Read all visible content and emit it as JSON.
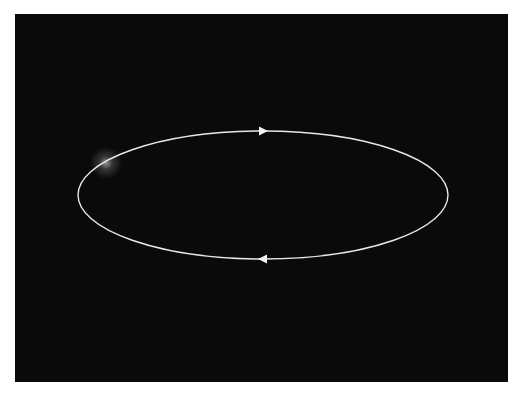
{
  "diagram": {
    "type": "orbit-loop",
    "background_color": "#0a0a0a",
    "page_color": "#ffffff",
    "stroke_color": "#e8e8e8",
    "ellipse": {
      "cx": 263,
      "cy": 195,
      "rx": 185,
      "ry": 64
    },
    "arrows": [
      {
        "position": "top",
        "direction": "right",
        "x": 263,
        "y": 131
      },
      {
        "position": "bottom",
        "direction": "left",
        "x": 263,
        "y": 259
      }
    ],
    "glow": {
      "x": 106,
      "y": 163,
      "radius": 14,
      "color": "#ffffff"
    }
  }
}
